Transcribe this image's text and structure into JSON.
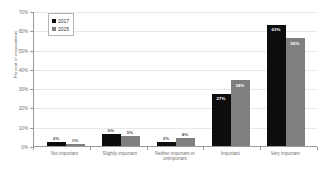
{
  "chart_data": {
    "type": "bar",
    "title": "",
    "xlabel": "",
    "ylabel": "Percent of respondents",
    "ylim": [
      0,
      70
    ],
    "ytick_labels": [
      "0%",
      "10%",
      "20%",
      "30%",
      "40%",
      "50%",
      "60%",
      "70%"
    ],
    "ytick_values": [
      0,
      10,
      20,
      30,
      40,
      50,
      60,
      70
    ],
    "grid": true,
    "legend_position": "top-left",
    "categories": [
      "Not important",
      "Slightly important",
      "Neither important or unimportant",
      "Important",
      "Very important"
    ],
    "series": [
      {
        "name": "2017",
        "color": "#0d0d0d",
        "values": [
          2,
          6,
          2,
          27,
          63
        ],
        "labels": [
          "2%",
          "6%",
          "2%",
          "27%",
          "63%"
        ]
      },
      {
        "name": "2015",
        "color": "#7f7f7f",
        "values": [
          1,
          5,
          4,
          34,
          56
        ],
        "labels": [
          "1%",
          "5%",
          "4%",
          "34%",
          "56%"
        ]
      }
    ]
  },
  "legend": {
    "items": [
      {
        "label": "2017",
        "color": "#0d0d0d"
      },
      {
        "label": "2015",
        "color": "#7f7f7f"
      }
    ]
  },
  "axis": {
    "y_title": "Percent of respondents"
  }
}
